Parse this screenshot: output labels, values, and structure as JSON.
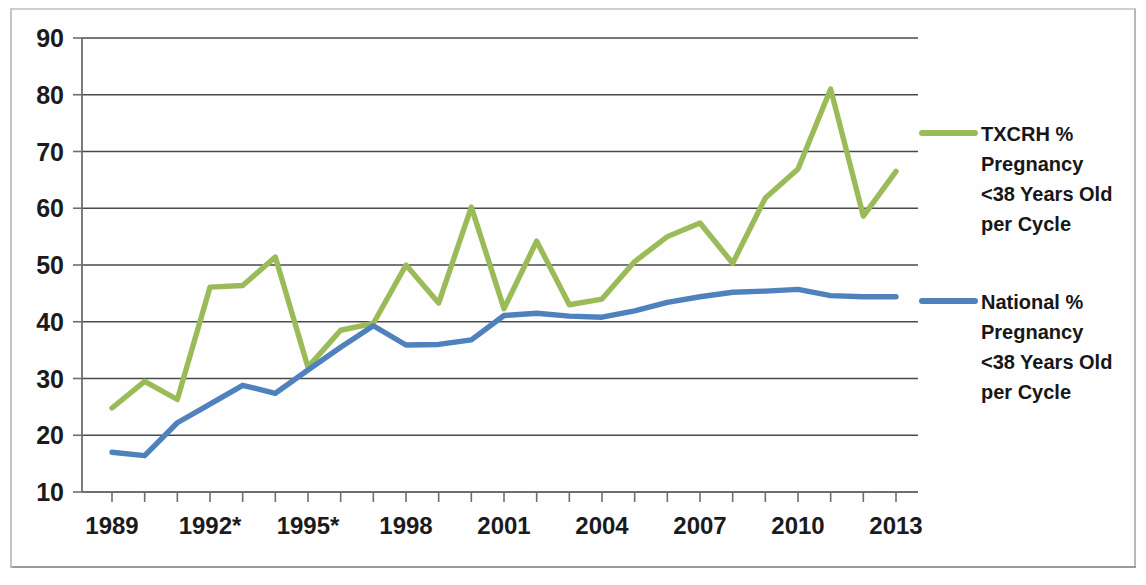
{
  "chart_data": {
    "type": "line",
    "title": "",
    "subtitle": "",
    "xlabel": "",
    "ylabel": "",
    "grid": true,
    "legend_position": "right",
    "ylim": [
      10,
      90
    ],
    "yticks": [
      10,
      20,
      30,
      40,
      50,
      60,
      70,
      80,
      90
    ],
    "xlim": [
      1989,
      2013
    ],
    "x": [
      1989,
      1990,
      1991,
      1992,
      1993,
      1994,
      1995,
      1996,
      1997,
      1998,
      1999,
      2000,
      2001,
      2002,
      2003,
      2004,
      2005,
      2006,
      2007,
      2008,
      2009,
      2010,
      2011,
      2012,
      2013
    ],
    "xtick_labels": [
      "1989",
      "1992*",
      "1995*",
      "1998",
      "2001",
      "2004",
      "2007",
      "2010",
      "2013"
    ],
    "xtick_values": [
      1989,
      1992,
      1995,
      1998,
      2001,
      2004,
      2007,
      2010,
      2013
    ],
    "series": [
      {
        "name": "TXCRH % Pregnancy <38 Years Old per Cycle",
        "color": "#9BBB59",
        "values": [
          24.8,
          29.5,
          26.3,
          46.1,
          46.4,
          51.4,
          32.0,
          38.5,
          39.7,
          50.0,
          43.3,
          60.2,
          42.3,
          54.2,
          43.0,
          44.0,
          50.6,
          55.0,
          57.4,
          50.3,
          61.8,
          66.9,
          81.0,
          58.6,
          66.5
        ]
      },
      {
        "name": "National % Pregnancy <38 Years Old per Cycle",
        "color": "#4F81BD",
        "values": [
          17.0,
          16.4,
          22.2,
          25.5,
          28.8,
          27.4,
          31.5,
          35.5,
          39.3,
          35.9,
          36.0,
          36.8,
          41.1,
          41.5,
          41.0,
          40.8,
          41.9,
          43.4,
          44.4,
          45.2,
          45.4,
          45.7,
          44.6,
          44.4,
          44.4
        ]
      }
    ]
  },
  "legend": [
    {
      "key": "legend-entry-txcrh",
      "swatch_name": "legend-swatch-txcrh",
      "color": "#9BBB59",
      "lines": [
        "TXCRH %",
        "Pregnancy",
        "<38 Years Old",
        "per Cycle"
      ]
    },
    {
      "key": "legend-entry-national",
      "swatch_name": "legend-swatch-national",
      "color": "#4F81BD",
      "lines": [
        "National %",
        "Pregnancy",
        "<38 Years Old",
        "per Cycle"
      ]
    }
  ]
}
